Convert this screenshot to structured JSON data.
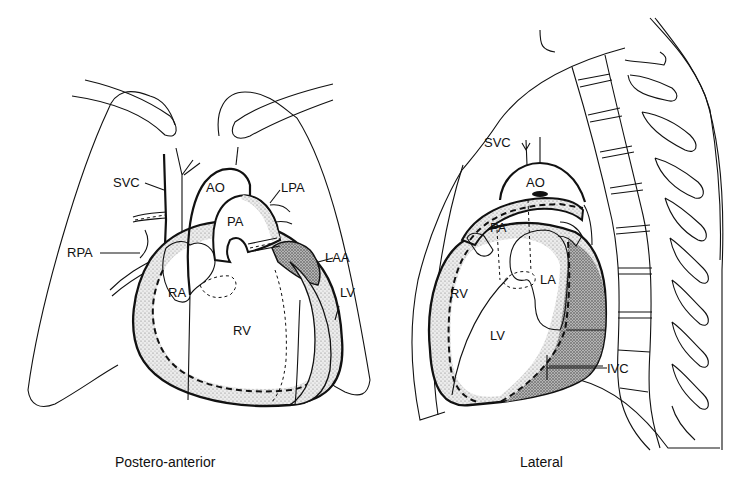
{
  "figure": {
    "panels": [
      {
        "id": "postero-anterior",
        "caption": "Postero-anterior",
        "labels": {
          "svc": "SVC",
          "ao": "AO",
          "lpa": "LPA",
          "pa": "PA",
          "rpa": "RPA",
          "laa": "LAA",
          "ra": "RA",
          "lv": "LV",
          "rv": "RV"
        }
      },
      {
        "id": "lateral",
        "caption": "Lateral",
        "labels": {
          "svc": "SVC",
          "ao": "AO",
          "pa": "PA",
          "rv": "RV",
          "la": "LA",
          "lv": "LV",
          "ivc": "IVC"
        }
      }
    ],
    "colors": {
      "ink": "#111111",
      "stipple_light": "#d9d9d9",
      "stipple_dark": "#9a9a9a",
      "background": "#ffffff"
    }
  }
}
